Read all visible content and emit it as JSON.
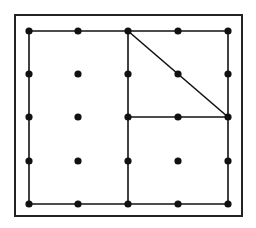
{
  "diagram": {
    "type": "geoboard",
    "colors": {
      "background": "#ffffff",
      "ink": "#111111",
      "frame": "#222222"
    },
    "frame": {
      "x": 15,
      "y": 15,
      "width": 227,
      "height": 201
    },
    "grid": {
      "columns": [
        29,
        78,
        128,
        178,
        228
      ],
      "rows": [
        31,
        74,
        117,
        161,
        204
      ],
      "dot_radius": 3.6
    },
    "segments": [
      {
        "name": "top-edge",
        "from": [
          0,
          0
        ],
        "to": [
          4,
          0
        ]
      },
      {
        "name": "right-edge",
        "from": [
          4,
          0
        ],
        "to": [
          4,
          4
        ]
      },
      {
        "name": "bottom-edge",
        "from": [
          0,
          4
        ],
        "to": [
          4,
          4
        ]
      },
      {
        "name": "left-edge",
        "from": [
          0,
          0
        ],
        "to": [
          0,
          4
        ]
      },
      {
        "name": "center-vertical",
        "from": [
          2,
          0
        ],
        "to": [
          2,
          4
        ]
      },
      {
        "name": "middle-horizontal-right",
        "from": [
          2,
          2
        ],
        "to": [
          4,
          2
        ]
      },
      {
        "name": "diagonal",
        "from": [
          2,
          0
        ],
        "to": [
          4,
          2
        ]
      }
    ]
  }
}
